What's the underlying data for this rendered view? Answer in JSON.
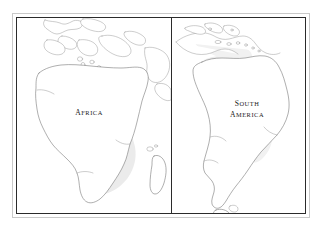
{
  "figure": {
    "type": "two-panel-outline-map",
    "background_color": "#ffffff",
    "outer_frame_color": "#c9c9c9",
    "inner_frame_color": "#2b2b2b",
    "divider_color": "#2b2b2b",
    "coastline_color": "#6d6d6d",
    "shading_color": "#ebebeb",
    "label_color": "#1a1a1a"
  },
  "panels": [
    {
      "id": "africa",
      "position": "left",
      "label": "AFRICA",
      "label_lines": [
        "AFRICA"
      ],
      "landmasses": [
        "Africa",
        "Europe",
        "Mediterranean",
        "Arabian Peninsula",
        "Madagascar"
      ]
    },
    {
      "id": "south-america",
      "position": "right",
      "label": "SOUTH AMERICA",
      "label_lines": [
        "SOUTH",
        "AMERICA"
      ],
      "landmasses": [
        "South America",
        "Central America",
        "Caribbean Islands",
        "Tierra del Fuego"
      ]
    }
  ]
}
